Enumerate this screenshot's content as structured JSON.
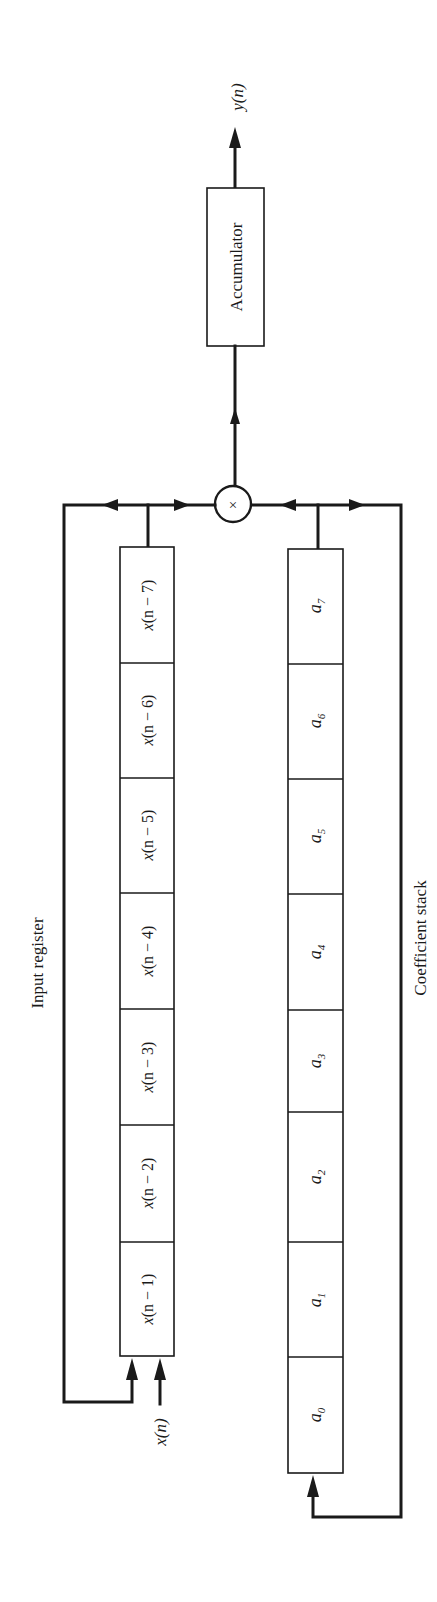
{
  "diagram": {
    "output_label": "y(n)",
    "input_label": "x(n)",
    "multiplier_symbol": "×",
    "accumulator_label": "Accumulator",
    "input_register_label": "Input register",
    "coefficient_stack_label": "Coefficient stack",
    "input_register_cells": [
      {
        "var": "x",
        "arg": "(n − 7)"
      },
      {
        "var": "x",
        "arg": "(n − 6)"
      },
      {
        "var": "x",
        "arg": "(n − 5)"
      },
      {
        "var": "x",
        "arg": "(n − 4)"
      },
      {
        "var": "x",
        "arg": "(n − 3)"
      },
      {
        "var": "x",
        "arg": "(n − 2)"
      },
      {
        "var": "x",
        "arg": "(n − 1)"
      }
    ],
    "coefficient_cells": [
      {
        "var": "a",
        "sub": "7"
      },
      {
        "var": "a",
        "sub": "6"
      },
      {
        "var": "a",
        "sub": "5"
      },
      {
        "var": "a",
        "sub": "4"
      },
      {
        "var": "a",
        "sub": "3"
      },
      {
        "var": "a",
        "sub": "2"
      },
      {
        "var": "a",
        "sub": "1"
      },
      {
        "var": "a",
        "sub": "0"
      }
    ],
    "colors": {
      "ink": "#1a1a1a",
      "background": "#ffffff"
    }
  }
}
